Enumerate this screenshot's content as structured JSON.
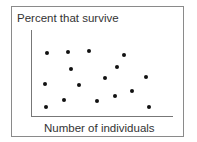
{
  "chart_data": {
    "type": "scatter",
    "title": "",
    "ylabel": "Percent that survive",
    "xlabel": "Number of individuals",
    "grid": false,
    "legend": null,
    "axis_ticks": false,
    "points_px": [
      {
        "x": 47,
        "y": 53
      },
      {
        "x": 68,
        "y": 52
      },
      {
        "x": 89,
        "y": 51
      },
      {
        "x": 124,
        "y": 55
      },
      {
        "x": 71,
        "y": 69
      },
      {
        "x": 117,
        "y": 67
      },
      {
        "x": 45,
        "y": 84
      },
      {
        "x": 79,
        "y": 85
      },
      {
        "x": 105,
        "y": 78
      },
      {
        "x": 146,
        "y": 77
      },
      {
        "x": 132,
        "y": 91
      },
      {
        "x": 115,
        "y": 96
      },
      {
        "x": 46,
        "y": 107
      },
      {
        "x": 64,
        "y": 100
      },
      {
        "x": 97,
        "y": 101
      },
      {
        "x": 149,
        "y": 107
      }
    ],
    "note": "No numeric scale shown; points scattered with no clear trend"
  }
}
